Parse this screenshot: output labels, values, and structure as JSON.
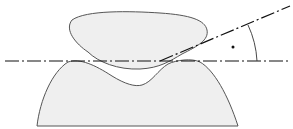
{
  "diagram": {
    "elements": {
      "upper_body": "upper rounded body",
      "lower_body": "lower body with concave notch",
      "horizontal_axis": "horizontal dash-dot reference line",
      "inclined_axis": "inclined dash-dot line",
      "angle_arc": "angle arc between lines",
      "angle_marker": "dot marking angle"
    },
    "colors": {
      "fill": "#efefef",
      "outline": "#555555",
      "line": "#111111"
    }
  }
}
